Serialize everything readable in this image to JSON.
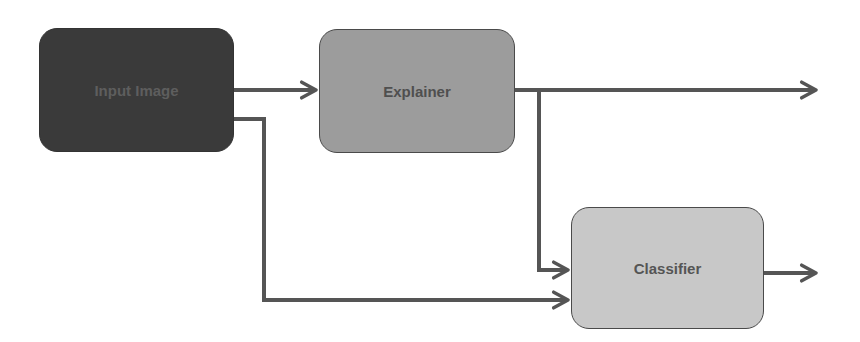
{
  "diagram": {
    "nodes": [
      {
        "id": "input",
        "label": "Input Image",
        "fill": "#3a3a3a"
      },
      {
        "id": "explainer",
        "label": "Explainer",
        "fill": "#9c9c9c"
      },
      {
        "id": "classifier",
        "label": "Classifier",
        "fill": "#c8c8c8"
      }
    ],
    "edges": [
      {
        "from": "input",
        "to": "explainer"
      },
      {
        "from": "explainer",
        "to": "output"
      },
      {
        "from": "explainer",
        "to": "classifier"
      },
      {
        "from": "input",
        "to": "classifier"
      },
      {
        "from": "classifier",
        "to": "output"
      }
    ],
    "edge_color": "#555555"
  }
}
